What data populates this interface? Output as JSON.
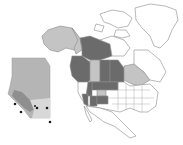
{
  "map": {
    "type": "choropleth",
    "region": "North America",
    "colors": {
      "background": "#ffffff",
      "land": "#ffffff",
      "outline": "#8a8a8a",
      "dark_shade": "#6b6b6b",
      "light_shade": "#c4c4c4",
      "inset_base": "#b5b5b5",
      "inset_light": "#d8d8d8",
      "inset_dark": "#8f8f8f",
      "marker": "#1a1a1a"
    },
    "dark_regions": [
      "British Columbia",
      "Northwest Territories",
      "Saskatchewan",
      "Manitoba",
      "Montana",
      "North Dakota",
      "Idaho",
      "Nevada",
      "Utah",
      "Colorado"
    ],
    "light_regions": [
      "Alaska",
      "Yukon",
      "Alberta",
      "Ontario",
      "Wyoming"
    ],
    "inset": {
      "label": "Alberta",
      "markers": 6
    }
  }
}
